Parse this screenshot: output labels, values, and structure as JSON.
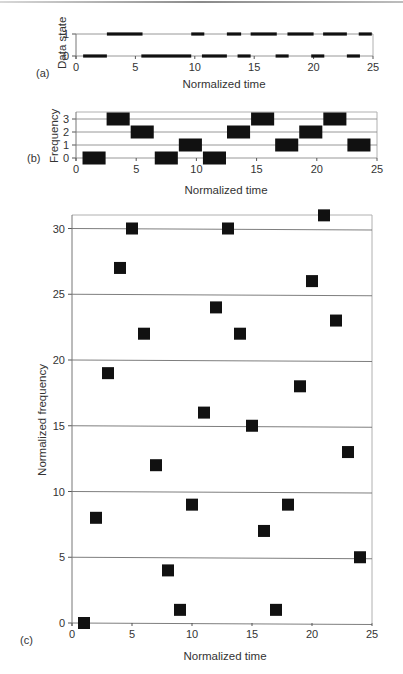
{
  "figure": {
    "panels": [
      {
        "id": "a",
        "label": "(a)",
        "ylabel": "Data state",
        "xlabel": "Normalized time"
      },
      {
        "id": "b",
        "label": "(b)",
        "ylabel": "Frequency",
        "xlabel": "Normalized time"
      },
      {
        "id": "c",
        "label": "(c)",
        "ylabel": "Normalized frequency",
        "xlabel": "Normalized time"
      }
    ]
  },
  "chart_data": [
    {
      "panel": "a",
      "type": "line",
      "title": "",
      "xlabel": "Normalized time",
      "ylabel": "Data state",
      "xlim": [
        0,
        25
      ],
      "ylim": [
        0,
        1
      ],
      "xticks": [
        0,
        5,
        10,
        15,
        20,
        25
      ],
      "yticks": [
        0,
        1
      ],
      "grid": true,
      "segments": [
        {
          "state": 0,
          "start": 0.6,
          "end": 2.6
        },
        {
          "state": 1,
          "start": 2.6,
          "end": 5.6
        },
        {
          "state": 0,
          "start": 5.5,
          "end": 9.7
        },
        {
          "state": 1,
          "start": 9.7,
          "end": 10.8
        },
        {
          "state": 0,
          "start": 10.6,
          "end": 12.7
        },
        {
          "state": 1,
          "start": 12.7,
          "end": 13.9
        },
        {
          "state": 0,
          "start": 13.6,
          "end": 14.7
        },
        {
          "state": 1,
          "start": 14.7,
          "end": 16.9
        },
        {
          "state": 0,
          "start": 16.8,
          "end": 17.9
        },
        {
          "state": 1,
          "start": 17.8,
          "end": 20.0
        },
        {
          "state": 0,
          "start": 19.8,
          "end": 20.9
        },
        {
          "state": 1,
          "start": 20.8,
          "end": 22.8
        },
        {
          "state": 0,
          "start": 22.8,
          "end": 23.9
        },
        {
          "state": 1,
          "start": 23.8,
          "end": 24.9
        }
      ]
    },
    {
      "panel": "b",
      "type": "scatter",
      "title": "",
      "xlabel": "Normalized time",
      "ylabel": "Frequency",
      "xlim": [
        0,
        25
      ],
      "ylim": [
        0,
        3
      ],
      "xticks": [
        0,
        5,
        10,
        15,
        20,
        25
      ],
      "yticks": [
        0,
        1,
        2,
        3
      ],
      "grid": true,
      "marker": "wide-rectangle",
      "marker_width_units": 2,
      "x": [
        1.5,
        3.5,
        5.5,
        7.5,
        9.5,
        11.5,
        13.5,
        15.5,
        17.5,
        19.5,
        21.5,
        23.5
      ],
      "y": [
        0,
        3,
        2,
        0,
        1,
        0,
        2,
        3,
        1,
        2,
        3,
        1
      ]
    },
    {
      "panel": "c",
      "type": "scatter",
      "title": "",
      "xlabel": "Normalized time",
      "ylabel": "Normalized frequency",
      "xlim": [
        0,
        25
      ],
      "ylim": [
        0,
        31
      ],
      "xticks": [
        0,
        5,
        10,
        15,
        20,
        25
      ],
      "yticks": [
        0,
        5,
        10,
        15,
        20,
        25,
        30
      ],
      "grid": true,
      "marker": "square",
      "x": [
        1,
        2,
        3,
        4,
        5,
        6,
        7,
        8,
        9,
        10,
        11,
        12,
        13,
        14,
        15,
        16,
        17,
        18,
        19,
        20,
        21,
        22,
        23,
        24
      ],
      "y": [
        0,
        8,
        19,
        27,
        30,
        22,
        12,
        4,
        1,
        9,
        16,
        24,
        30,
        22,
        15,
        7,
        1,
        9,
        18,
        26,
        31,
        23,
        13,
        5
      ]
    }
  ],
  "colors": {
    "marker": "#111111",
    "grid": "#8c8c8c",
    "frame": "#b0b0b0",
    "text": "#333333"
  }
}
